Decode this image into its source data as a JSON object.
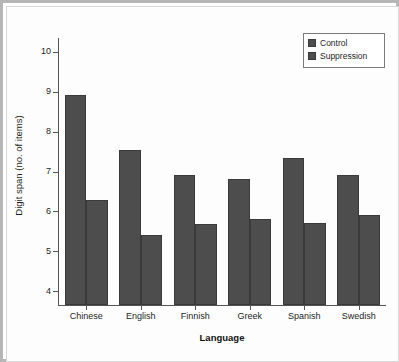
{
  "chart_data": {
    "type": "bar",
    "title": "",
    "xlabel": "Language",
    "ylabel": "Digit span (no. of items)",
    "categories": [
      "Chinese",
      "English",
      "Finnish",
      "Greek",
      "Spanish",
      "Swedish"
    ],
    "series": [
      {
        "name": "Control",
        "color": "#4d4d4d",
        "values": [
          8.93,
          7.55,
          6.92,
          6.82,
          7.35,
          6.9
        ]
      },
      {
        "name": "Suppression",
        "color": "#4d4d4d",
        "values": [
          6.28,
          5.4,
          5.68,
          5.82,
          5.72,
          5.9
        ]
      }
    ],
    "ylim": [
      3.65,
      10.35
    ],
    "yticks": [
      4,
      5,
      6,
      7,
      8,
      9,
      10
    ],
    "ytick_labels": [
      "4",
      "5",
      "6",
      "7",
      "8",
      "9",
      "10"
    ],
    "grid": false,
    "legend_position": "top-right",
    "legend_entries": [
      "Control",
      "Suppression"
    ]
  },
  "figure": {
    "frame_color": "#b6b6b6",
    "background": "#ffffff",
    "axis_color": "#555555",
    "bar_color": "#4d4d4d",
    "bar_edge_color": "#3a3a3a"
  }
}
